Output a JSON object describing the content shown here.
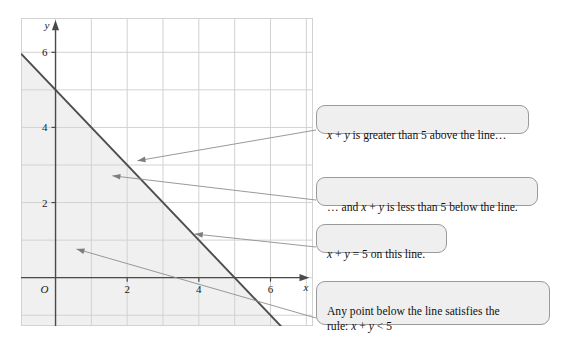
{
  "figure": {
    "title": "",
    "background_color": "#ffffff"
  },
  "chart_data": {
    "type": "line",
    "title": "",
    "xlabel": "x",
    "ylabel": "y",
    "xlim": [
      -0.95,
      7.2
    ],
    "ylim": [
      -1.3,
      6.9
    ],
    "xticks": [
      2,
      4,
      6
    ],
    "xtick_labels": [
      "2",
      "4",
      "6"
    ],
    "yticks": [
      2,
      4,
      6
    ],
    "ytick_labels": [
      "2",
      "4",
      "6"
    ],
    "origin_label": "O",
    "grid": true,
    "grid_step": 1,
    "grid_color": "#cfcfcf",
    "axis_color": "#4a4a4a",
    "series": [
      {
        "name": "x + y = 5",
        "equation": "x + y = 5",
        "type": "line",
        "color": "#4d4d4d",
        "width": 1.9,
        "points": [
          {
            "x": -0.95,
            "y": 5.95
          },
          {
            "x": 7.2,
            "y": -2.2
          }
        ],
        "x_intercept": 5,
        "y_intercept": 5,
        "slope": -1
      }
    ],
    "shaded_region": {
      "label": "x + y < 5",
      "description": "region below the line x + y = 5",
      "fill_color": "#f0f0f0",
      "inequality": "x + y < 5"
    },
    "annotations": [
      {
        "id": "annotation-above-line",
        "text_plain": "x + y is greater than 5 above the line…",
        "text_parts": [
          {
            "t": "x",
            "italic": true
          },
          {
            "t": " + ",
            "italic": false
          },
          {
            "t": "y",
            "italic": true
          },
          {
            "t": " is greater than 5 above the line…",
            "italic": false
          }
        ],
        "arrow_target": {
          "x": 2.3,
          "y": 3.1
        }
      },
      {
        "id": "annotation-below-line",
        "text_plain": "… and x + y is less than 5 below the line.",
        "text_parts": [
          {
            "t": "… and ",
            "italic": false
          },
          {
            "t": "x",
            "italic": true
          },
          {
            "t": " + ",
            "italic": false
          },
          {
            "t": "y",
            "italic": true
          },
          {
            "t": " is less than 5 below the line.",
            "italic": false
          }
        ],
        "arrow_target": {
          "x": 1.6,
          "y": 2.7
        }
      },
      {
        "id": "annotation-on-line",
        "text_plain": "x + y = 5 on this line.",
        "text_parts": [
          {
            "t": "x",
            "italic": true
          },
          {
            "t": " + ",
            "italic": false
          },
          {
            "t": "y",
            "italic": true
          },
          {
            "t": " = 5 on this line.",
            "italic": false
          }
        ],
        "arrow_target": {
          "x": 3.9,
          "y": 1.15
        }
      },
      {
        "id": "annotation-any-point",
        "text_plain": "Any point below the line satisfies the rule: x + y < 5",
        "text_parts": [
          {
            "t": "Any point below the line satisfies the",
            "italic": false
          },
          {
            "t": "\n",
            "italic": false
          },
          {
            "t": "rule: ",
            "italic": false
          },
          {
            "t": "x",
            "italic": true
          },
          {
            "t": " + ",
            "italic": false
          },
          {
            "t": "y",
            "italic": true
          },
          {
            "t": " < 5",
            "italic": false
          }
        ],
        "arrow_target": {
          "x": 0.6,
          "y": 0.75
        }
      }
    ]
  },
  "callouts": [
    {
      "id": "callout-1",
      "text": "x + y is greater than 5 above the line…"
    },
    {
      "id": "callout-2",
      "text": "… and x + y is less than 5 below the line."
    },
    {
      "id": "callout-3",
      "text": "x + y = 5 on this line."
    },
    {
      "id": "callout-4",
      "text": "Any point below the line satisfies the\nrule: x + y < 5"
    }
  ],
  "axes": {
    "x_name": "x",
    "y_name": "y",
    "origin": "O",
    "x_tick_labels": [
      "2",
      "4",
      "6"
    ],
    "y_tick_labels": [
      "2",
      "4",
      "6"
    ]
  }
}
